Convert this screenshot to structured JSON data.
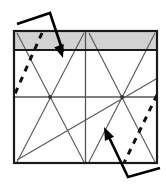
{
  "figure": {
    "canvas": {
      "width": 166,
      "height": 184
    },
    "colors": {
      "background": "#ffffff",
      "frame_stroke": "#1a1a1a",
      "band_fill": "#d2d2d2",
      "band_stroke": "#1a1a1a",
      "thin_line": "#555555",
      "dashed_line": "#111111",
      "arrow": "#000000"
    },
    "frame": {
      "name": "outer-square-frame",
      "x": 14,
      "y": 31,
      "width": 143,
      "height": 132,
      "stroke_width": 2.2
    },
    "band": {
      "name": "shaded-top-band",
      "label": "shaded strip",
      "x": 14,
      "y": 32,
      "width": 143,
      "height": 18
    },
    "axes": [
      {
        "name": "center-horizontal-line",
        "x1": 14,
        "y1": 97,
        "x2": 157,
        "y2": 97
      },
      {
        "name": "center-vertical-line",
        "x1": 85.5,
        "y1": 31,
        "x2": 85.5,
        "y2": 163
      }
    ],
    "nodes": [
      {
        "name": "left-crossing-node",
        "cx": 50,
        "cy": 97,
        "r": 1.9
      },
      {
        "name": "right-crossing-node",
        "cx": 122,
        "cy": 97,
        "r": 1.9
      }
    ],
    "thin_lines": [
      {
        "name": "left-x-line-a",
        "x1": 17,
        "y1": 33,
        "x2": 84,
        "y2": 162
      },
      {
        "name": "left-x-line-b",
        "x1": 84,
        "y1": 33,
        "x2": 17,
        "y2": 162
      },
      {
        "name": "right-x-line-a",
        "x1": 89,
        "y1": 33,
        "x2": 155,
        "y2": 162
      },
      {
        "name": "right-x-line-b",
        "x1": 155,
        "y1": 33,
        "x2": 89,
        "y2": 162
      },
      {
        "name": "long-shallow-diagonal",
        "x1": 17,
        "y1": 160,
        "x2": 156,
        "y2": 79
      }
    ],
    "dashed_lines": [
      {
        "name": "left-dashed-diagonal",
        "x1": 42,
        "y1": 33,
        "x2": 14,
        "y2": 96,
        "dash": "6 6",
        "width": 3.0
      },
      {
        "name": "right-dashed-diagonal",
        "x1": 157,
        "y1": 95,
        "x2": 124,
        "y2": 163,
        "dash": "6 6",
        "width": 3.0
      }
    ],
    "annotations": [
      {
        "name": "top-left-callout-arrow",
        "label": "upper annotation arrow",
        "points": "17,24 50,13 63,52",
        "tip": {
          "x": 63,
          "y": 58
        },
        "head": "14,44 26,46 20,58",
        "head_angle_deg": 72,
        "stroke_width": 2.6
      },
      {
        "name": "bottom-right-callout-arrow",
        "label": "lower annotation arrow",
        "points": "160,168 128,177 107,133",
        "tip": {
          "x": 104,
          "y": 127
        },
        "head": "99,143 112,141 106,128",
        "head_angle_deg": 245,
        "stroke_width": 2.6
      }
    ]
  }
}
